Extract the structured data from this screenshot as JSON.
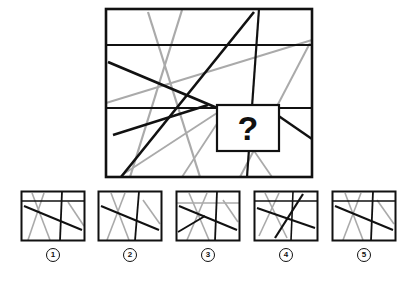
{
  "puzzle": {
    "type": "visual-pattern-completion",
    "prompt_symbol": "?",
    "colors": {
      "dark_line": "#111111",
      "gray_line": "#aaaaaa",
      "border": "#111111",
      "background": "#ffffff",
      "label_text": "#111111"
    },
    "stimulus": {
      "name": "main-figure",
      "viewbox": "0 0 212 174",
      "frame": {
        "x": 2,
        "y": 2,
        "width": 206,
        "height": 168,
        "stroke_width": 2.6
      },
      "dark_lines": [
        {
          "name": "horizontal-upper",
          "x1": 2,
          "y1": 38,
          "x2": 208,
          "y2": 38,
          "w": 1.9
        },
        {
          "name": "horizontal-lower",
          "x1": 2,
          "y1": 101,
          "x2": 208,
          "y2": 101,
          "w": 1.9
        },
        {
          "name": "vertical-right",
          "x1": 155,
          "y1": 2,
          "x2": 143,
          "y2": 170,
          "w": 2.2
        },
        {
          "name": "diagonal-rising-long",
          "x1": 17,
          "y1": 170,
          "x2": 150,
          "y2": 5,
          "w": 2.6
        },
        {
          "name": "diagonal-falling-long",
          "x1": 4,
          "y1": 55,
          "x2": 118,
          "y2": 103,
          "w": 2.6
        },
        {
          "name": "diagonal-falling-short",
          "x1": 9,
          "y1": 128,
          "x2": 104,
          "y2": 98,
          "w": 2.4
        },
        {
          "name": "diagonal-right-descend",
          "x1": 163,
          "y1": 101,
          "x2": 208,
          "y2": 132,
          "w": 2.4
        }
      ],
      "gray_lines": [
        {
          "name": "gray-steep-left",
          "x1": 44,
          "y1": 5,
          "x2": 96,
          "y2": 170,
          "w": 2.2
        },
        {
          "name": "gray-steep-mid",
          "x1": 78,
          "y1": 3,
          "x2": 26,
          "y2": 170,
          "w": 2.2
        },
        {
          "name": "gray-shallow-cross",
          "x1": 2,
          "y1": 96,
          "x2": 208,
          "y2": 33,
          "w": 2.0
        },
        {
          "name": "gray-rising-right",
          "x1": 136,
          "y1": 170,
          "x2": 206,
          "y2": 36,
          "w": 2.0
        },
        {
          "name": "gray-fan-left",
          "x1": 116,
          "y1": 104,
          "x2": 18,
          "y2": 168,
          "w": 1.8
        },
        {
          "name": "gray-fan-mid",
          "x1": 120,
          "y1": 106,
          "x2": 78,
          "y2": 170,
          "w": 1.8
        },
        {
          "name": "gray-fan-right",
          "x1": 124,
          "y1": 106,
          "x2": 168,
          "y2": 170,
          "w": 1.8
        }
      ],
      "question_box": {
        "name": "question-box",
        "x": 113,
        "y": 98,
        "width": 62,
        "height": 46,
        "stroke_width": 2.2,
        "fill": "#ffffff"
      }
    },
    "options": [
      {
        "number": "1",
        "label": "1",
        "name": "option-1",
        "viewbox": "0 0 66 52",
        "frame": {
          "x": 1.5,
          "y": 1.5,
          "width": 63,
          "height": 49,
          "stroke_width": 2.0
        },
        "dark_lines": [
          {
            "x1": 1.5,
            "y1": 11,
            "x2": 64.5,
            "y2": 11,
            "w": 1.4
          },
          {
            "x1": 42,
            "y1": 1.5,
            "x2": 40,
            "y2": 50.5,
            "w": 1.8
          },
          {
            "x1": 4,
            "y1": 16,
            "x2": 62,
            "y2": 40,
            "w": 2.0
          }
        ],
        "gray_lines": [
          {
            "x1": 12,
            "y1": 3,
            "x2": 30,
            "y2": 50,
            "w": 1.6
          },
          {
            "x1": 24,
            "y1": 3,
            "x2": 8,
            "y2": 50,
            "w": 1.6
          },
          {
            "x1": 48,
            "y1": 12,
            "x2": 64,
            "y2": 36,
            "w": 1.6
          }
        ]
      },
      {
        "number": "2",
        "label": "2",
        "name": "option-2",
        "viewbox": "0 0 66 52",
        "frame": {
          "x": 1.5,
          "y": 1.5,
          "width": 63,
          "height": 49,
          "stroke_width": 2.0
        },
        "dark_lines": [
          {
            "x1": 42,
            "y1": 1.5,
            "x2": 38,
            "y2": 50.5,
            "w": 1.8
          },
          {
            "x1": 4,
            "y1": 16,
            "x2": 62,
            "y2": 40,
            "w": 2.0
          }
        ],
        "gray_lines": [
          {
            "x1": 14,
            "y1": 3,
            "x2": 32,
            "y2": 50,
            "w": 1.6
          },
          {
            "x1": 28,
            "y1": 3,
            "x2": 10,
            "y2": 50,
            "w": 1.6
          },
          {
            "x1": 46,
            "y1": 10,
            "x2": 63,
            "y2": 34,
            "w": 1.6
          }
        ]
      },
      {
        "number": "3",
        "label": "3",
        "name": "option-3",
        "viewbox": "0 0 66 52",
        "frame": {
          "x": 1.5,
          "y": 1.5,
          "width": 63,
          "height": 49,
          "stroke_width": 2.0
        },
        "dark_lines": [
          {
            "x1": 42,
            "y1": 1.5,
            "x2": 40,
            "y2": 50.5,
            "w": 1.8
          },
          {
            "x1": 4,
            "y1": 16,
            "x2": 62,
            "y2": 40,
            "w": 2.0
          },
          {
            "x1": 3,
            "y1": 42,
            "x2": 30,
            "y2": 26,
            "w": 1.8
          }
        ],
        "gray_lines": [
          {
            "x1": 1.5,
            "y1": 13,
            "x2": 64.5,
            "y2": 13,
            "w": 1.5
          },
          {
            "x1": 14,
            "y1": 3,
            "x2": 34,
            "y2": 50,
            "w": 1.6
          },
          {
            "x1": 32,
            "y1": 3,
            "x2": 12,
            "y2": 50,
            "w": 1.6
          },
          {
            "x1": 48,
            "y1": 10,
            "x2": 63,
            "y2": 32,
            "w": 1.6
          }
        ]
      },
      {
        "number": "4",
        "label": "4",
        "name": "option-4",
        "viewbox": "0 0 66 52",
        "frame": {
          "x": 1.5,
          "y": 1.5,
          "width": 63,
          "height": 49,
          "stroke_width": 2.0
        },
        "dark_lines": [
          {
            "x1": 1.5,
            "y1": 11,
            "x2": 64.5,
            "y2": 11,
            "w": 1.4
          },
          {
            "x1": 40,
            "y1": 1.5,
            "x2": 38,
            "y2": 50.5,
            "w": 1.6
          },
          {
            "x1": 22,
            "y1": 48,
            "x2": 50,
            "y2": 4,
            "w": 2.2
          },
          {
            "x1": 4,
            "y1": 18,
            "x2": 62,
            "y2": 38,
            "w": 2.0
          }
        ],
        "gray_lines": [
          {
            "x1": 12,
            "y1": 3,
            "x2": 34,
            "y2": 48,
            "w": 1.6
          },
          {
            "x1": 26,
            "y1": 3,
            "x2": 6,
            "y2": 46,
            "w": 1.6
          }
        ]
      },
      {
        "number": "5",
        "label": "5",
        "name": "option-5",
        "viewbox": "0 0 66 52",
        "frame": {
          "x": 1.5,
          "y": 1.5,
          "width": 63,
          "height": 49,
          "stroke_width": 2.0
        },
        "dark_lines": [
          {
            "x1": 1.5,
            "y1": 11,
            "x2": 64.5,
            "y2": 11,
            "w": 1.4
          },
          {
            "x1": 42,
            "y1": 1.5,
            "x2": 40,
            "y2": 50.5,
            "w": 1.8
          },
          {
            "x1": 4,
            "y1": 16,
            "x2": 62,
            "y2": 40,
            "w": 2.0
          }
        ],
        "gray_lines": [
          {
            "x1": 14,
            "y1": 3,
            "x2": 32,
            "y2": 50,
            "w": 1.6
          },
          {
            "x1": 30,
            "y1": 3,
            "x2": 12,
            "y2": 50,
            "w": 1.6
          },
          {
            "x1": 46,
            "y1": 10,
            "x2": 63,
            "y2": 34,
            "w": 1.6
          }
        ]
      }
    ],
    "option_positions_x": [
      20,
      97,
      175,
      253,
      331
    ]
  }
}
